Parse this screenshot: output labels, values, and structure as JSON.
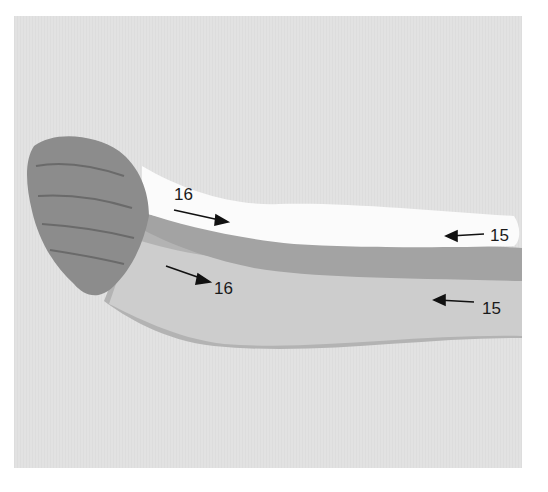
{
  "figure": {
    "colors": {
      "background": "#e2e2e2",
      "skin": "#9a9a9a",
      "tape_upper": "#fbfbfb",
      "tape_lower": "#cfcfcf",
      "arrow": "#111111"
    },
    "labels": [
      {
        "id": "upper-left",
        "text": "16",
        "arrow_direction": "right"
      },
      {
        "id": "lower-left",
        "text": "16",
        "arrow_direction": "right"
      },
      {
        "id": "upper-right",
        "text": "15",
        "arrow_direction": "left"
      },
      {
        "id": "lower-right",
        "text": "15",
        "arrow_direction": "left"
      }
    ]
  }
}
